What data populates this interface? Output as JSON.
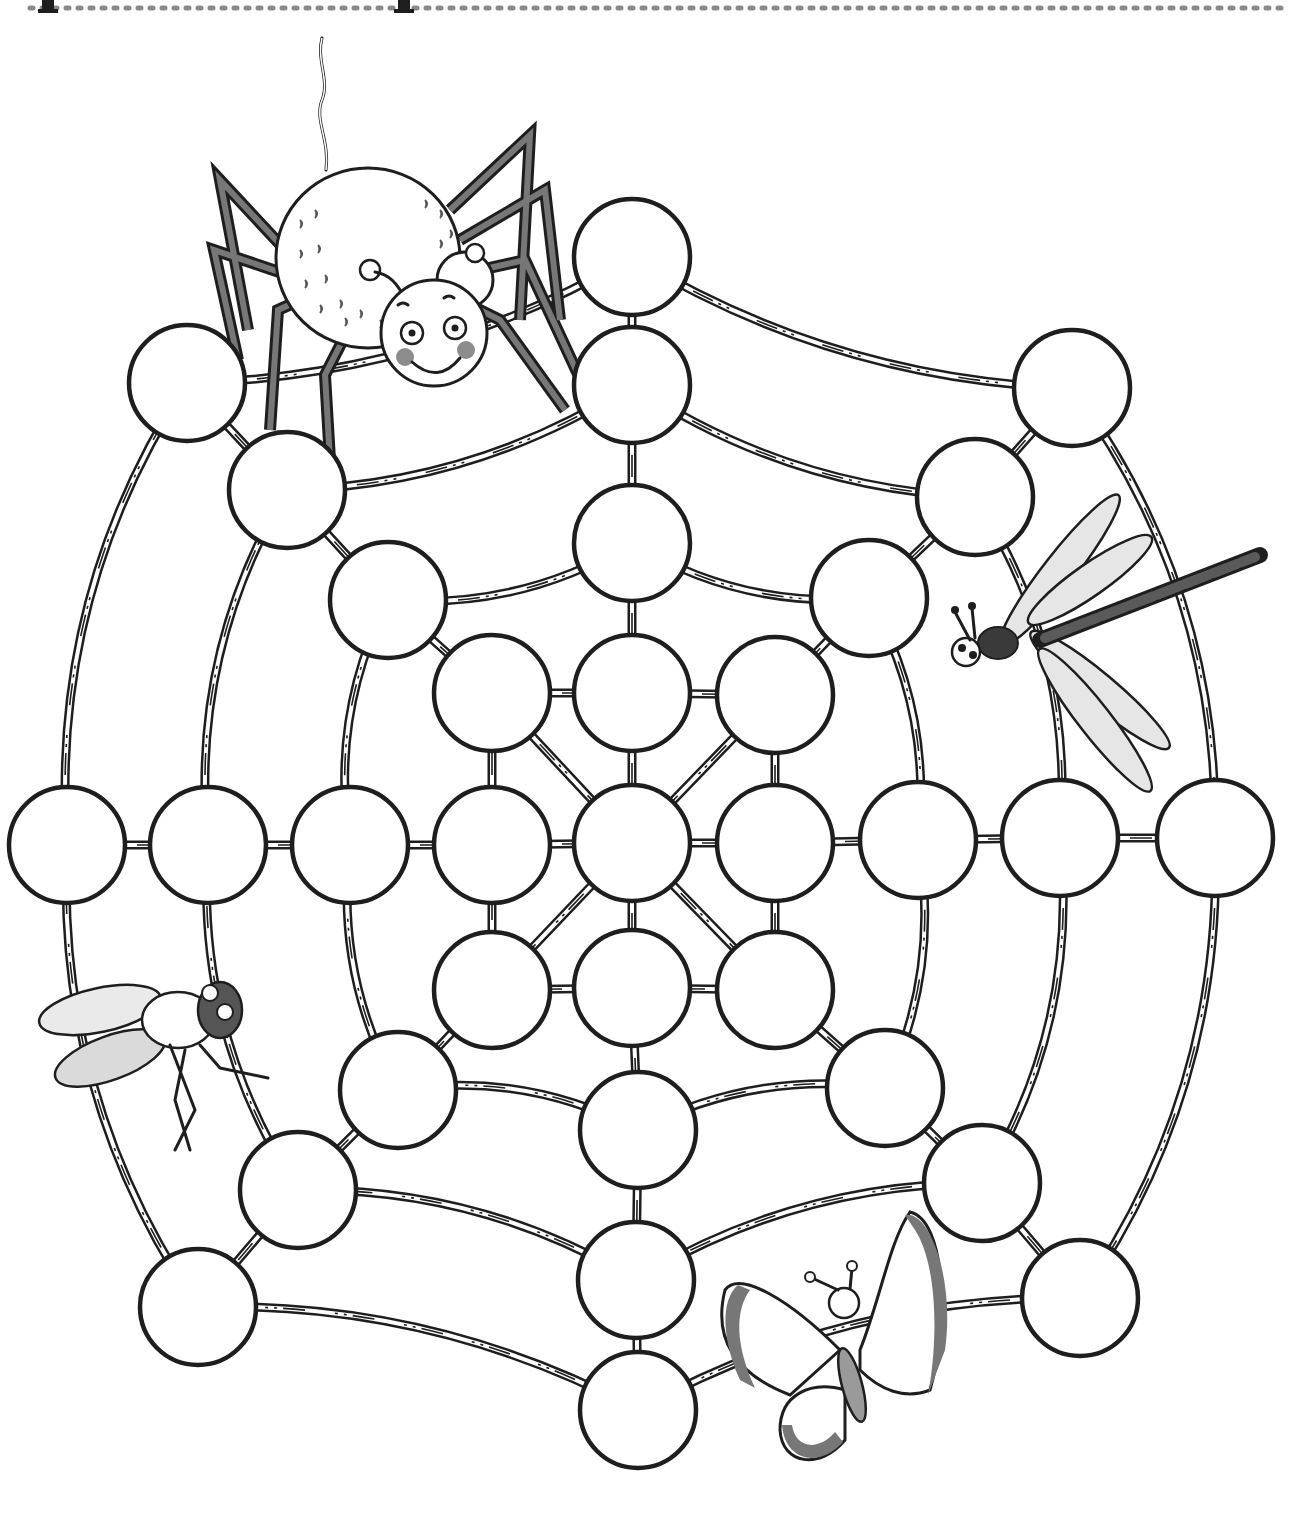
{
  "page": {
    "title_fragment": "p p",
    "header_rule": "dotted"
  },
  "board": {
    "circle_radius": 58,
    "circle_count": 40,
    "circles": [
      {
        "id": "c1",
        "x": 632,
        "y": 257
      },
      {
        "id": "c2",
        "x": 632,
        "y": 385
      },
      {
        "id": "c3",
        "x": 632,
        "y": 543
      },
      {
        "id": "c4",
        "x": 632,
        "y": 693
      },
      {
        "id": "c5",
        "x": 632,
        "y": 843
      },
      {
        "id": "c6",
        "x": 632,
        "y": 988
      },
      {
        "id": "c7",
        "x": 638,
        "y": 1130
      },
      {
        "id": "c8",
        "x": 636,
        "y": 1280
      },
      {
        "id": "c9",
        "x": 638,
        "y": 1410
      },
      {
        "id": "c10",
        "x": 187,
        "y": 383
      },
      {
        "id": "c11",
        "x": 287,
        "y": 490
      },
      {
        "id": "c12",
        "x": 388,
        "y": 600
      },
      {
        "id": "c13",
        "x": 492,
        "y": 693
      },
      {
        "id": "c14",
        "x": 1072,
        "y": 388
      },
      {
        "id": "c15",
        "x": 975,
        "y": 497
      },
      {
        "id": "c16",
        "x": 869,
        "y": 598
      },
      {
        "id": "c17",
        "x": 775,
        "y": 695
      },
      {
        "id": "c18",
        "x": 67,
        "y": 845
      },
      {
        "id": "c19",
        "x": 208,
        "y": 845
      },
      {
        "id": "c20",
        "x": 350,
        "y": 845
      },
      {
        "id": "c21",
        "x": 492,
        "y": 845
      },
      {
        "id": "c22",
        "x": 775,
        "y": 843
      },
      {
        "id": "c23",
        "x": 918,
        "y": 840
      },
      {
        "id": "c24",
        "x": 1060,
        "y": 838
      },
      {
        "id": "c25",
        "x": 1215,
        "y": 838
      },
      {
        "id": "c26",
        "x": 492,
        "y": 990
      },
      {
        "id": "c27",
        "x": 775,
        "y": 990
      },
      {
        "id": "c28",
        "x": 398,
        "y": 1090
      },
      {
        "id": "c29",
        "x": 885,
        "y": 1088
      },
      {
        "id": "c30",
        "x": 298,
        "y": 1190
      },
      {
        "id": "c31",
        "x": 982,
        "y": 1183
      },
      {
        "id": "c32",
        "x": 198,
        "y": 1307
      },
      {
        "id": "c33",
        "x": 1080,
        "y": 1298
      }
    ]
  },
  "insects": [
    {
      "name": "spider",
      "position": "top-left"
    },
    {
      "name": "dragonfly",
      "position": "right"
    },
    {
      "name": "fly",
      "position": "left"
    },
    {
      "name": "butterfly",
      "position": "bottom-right"
    }
  ],
  "colors": {
    "ink": "#1e1e1e",
    "paper": "#ffffff",
    "shade": "#8c8c8c",
    "dark_shade": "#3a3a3a"
  }
}
